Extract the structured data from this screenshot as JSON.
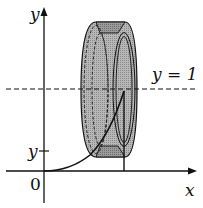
{
  "diagram": {
    "title": "",
    "labels": {
      "y_axis": "y",
      "x_axis": "x",
      "origin": "0",
      "y_tick": "y",
      "line_label": "y = 1"
    },
    "colors": {
      "ring_fill": "#a8a8a8",
      "ring_dark": "#7a7a7a",
      "stroke": "#111111"
    }
  }
}
